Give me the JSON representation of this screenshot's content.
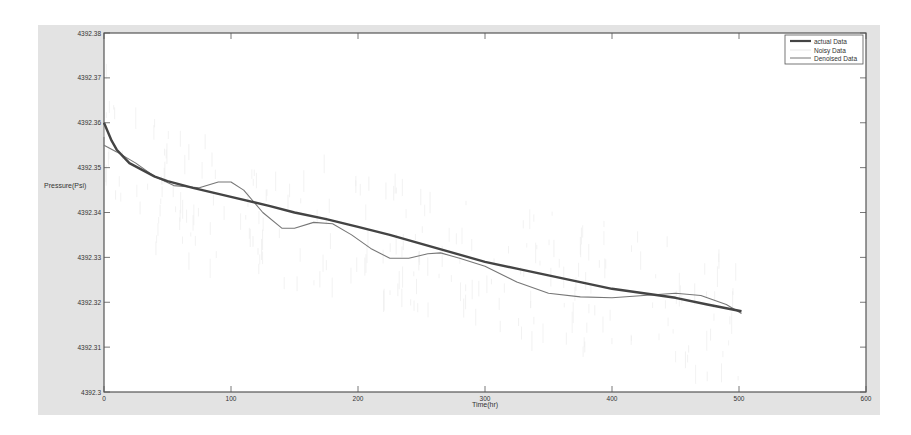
{
  "chart_data": {
    "type": "line",
    "title": "",
    "xlabel": "Time(hr)",
    "ylabel": "Pressure(Psi)",
    "xlim": [
      0,
      600
    ],
    "ylim": [
      4392.3,
      4392.38
    ],
    "x_ticks": [
      0,
      100,
      200,
      300,
      400,
      500,
      600
    ],
    "x_tick_labels": [
      "0",
      "100",
      "200",
      "300",
      "400",
      "500",
      "600"
    ],
    "y_ticks": [
      4392.3,
      4392.31,
      4392.32,
      4392.33,
      4392.34,
      4392.35,
      4392.36,
      4392.37,
      4392.38
    ],
    "y_tick_labels": [
      "4392.3",
      "4392.31",
      "4392.32",
      "4392.33",
      "4392.34",
      "4392.35",
      "4392.36",
      "4392.37",
      "4392.38"
    ],
    "grid": false,
    "legend_position": "top-right",
    "series": [
      {
        "name": "actual Data",
        "color": "#444444",
        "width": 2.4,
        "x": [
          0,
          3,
          6,
          10,
          15,
          20,
          30,
          40,
          50,
          70,
          100,
          130,
          150,
          175,
          200,
          225,
          250,
          275,
          300,
          325,
          350,
          375,
          400,
          425,
          450,
          475,
          502
        ],
        "y": [
          4392.36,
          4392.358,
          4392.356,
          4392.354,
          4392.3525,
          4392.351,
          4392.3495,
          4392.348,
          4392.347,
          4392.3455,
          4392.3435,
          4392.3415,
          4392.34,
          4392.3385,
          4392.3368,
          4392.335,
          4392.333,
          4392.331,
          4392.329,
          4392.3275,
          4392.326,
          4392.3245,
          4392.323,
          4392.322,
          4392.321,
          4392.3195,
          4392.318
        ]
      },
      {
        "name": "Noisy Data",
        "color": "#dcdcdc",
        "width": 0.6,
        "x": [],
        "y": []
      },
      {
        "name": "Denoised Data",
        "color": "#777777",
        "width": 1.1,
        "x": [
          0,
          10,
          25,
          40,
          55,
          75,
          90,
          100,
          110,
          125,
          140,
          150,
          165,
          180,
          195,
          210,
          225,
          240,
          255,
          265,
          280,
          300,
          325,
          350,
          375,
          400,
          425,
          450,
          470,
          490,
          502
        ],
        "y": [
          4392.355,
          4392.3535,
          4392.351,
          4392.348,
          4392.346,
          4392.3455,
          4392.3468,
          4392.3468,
          4392.345,
          4392.34,
          4392.3365,
          4392.3365,
          4392.3378,
          4392.3375,
          4392.335,
          4392.332,
          4392.3298,
          4392.3298,
          4392.3308,
          4392.331,
          4392.3298,
          4392.328,
          4392.3245,
          4392.322,
          4392.3212,
          4392.321,
          4392.3215,
          4392.322,
          4392.3215,
          4392.3195,
          4392.3175
        ]
      }
    ]
  },
  "legend": {
    "items": [
      {
        "label": "actual Data"
      },
      {
        "label": "Noisy Data"
      },
      {
        "label": "Denoised Data"
      }
    ]
  }
}
